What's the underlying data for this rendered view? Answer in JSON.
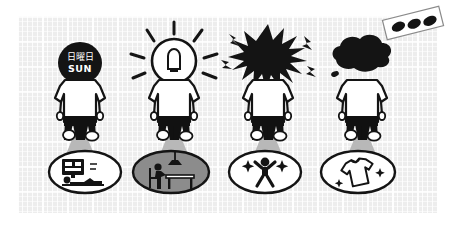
{
  "scene": {
    "title": "Daily routine four-panel illustration",
    "panel": {
      "name": "grid-paper-panel",
      "background_color": "#ededed",
      "grid_color": "#ffffff"
    },
    "palette": {
      "ink": "#1a1a1a",
      "shirt": "#ffffff",
      "pants": "#111111",
      "spotlight": "#b8b8b8",
      "oval_fill_gray": "#8c8c8c",
      "panel_bg": "#ededed"
    }
  },
  "figures": [
    {
      "id": "figure-sunday",
      "head_state": "black-round-head-with-calendar-text",
      "head_icon": "calendar-head-icon",
      "label_kanji": "日曜日",
      "label_roman": "SUN",
      "label_color": "#ffffff",
      "shirt_color": "#ffffff",
      "pants_color": "#111111",
      "spotlight": true
    },
    {
      "id": "figure-idea",
      "head_state": "glowing-lightbulb-head",
      "head_icon": "lightbulb-head-icon",
      "label_kanji": "",
      "label_roman": "",
      "ray_count": 8,
      "shirt_color": "#ffffff",
      "pants_color": "#111111",
      "spotlight": true
    },
    {
      "id": "figure-stress",
      "head_state": "spiky-black-explosion-head",
      "head_icon": "explosion-head-icon",
      "label_kanji": "",
      "label_roman": "",
      "bolt_count": 4,
      "shirt_color": "#ffffff",
      "pants_color": "#111111",
      "spotlight": true
    },
    {
      "id": "figure-gloom",
      "head_state": "dark-cloud-over-head",
      "head_icon": "rain-cloud-head-icon",
      "label_kanji": "",
      "label_roman": "",
      "shirt_color": "#ffffff",
      "pants_color": "#111111",
      "spotlight": true
    }
  ],
  "ovals": [
    {
      "id": "oval-watching-tv",
      "icon": "person-lying-watching-tv-icon",
      "fill": "#ffffff",
      "stroke": "#111111",
      "description": "person lying down in front of a television"
    },
    {
      "id": "oval-desk-work",
      "icon": "person-at-desk-with-lamp-icon",
      "fill": "#8c8c8c",
      "stroke": "#111111",
      "description": "person seated at a desk under a hanging lamp"
    },
    {
      "id": "oval-stretching",
      "icon": "person-arms-raised-sparkles-icon",
      "fill": "#ffffff",
      "stroke": "#111111",
      "description": "person with arms raised and sparkles"
    },
    {
      "id": "oval-clean-shirt",
      "icon": "clean-tshirt-sparkles-icon",
      "fill": "#ffffff",
      "stroke": "#111111",
      "description": "freshly laundered t-shirt with sparkles"
    }
  ],
  "tape": {
    "id": "tape-strip",
    "icon": "tape-strip-three-dots-icon",
    "dot_count": 3,
    "fill": "#ffffff",
    "dot_color": "#111111",
    "rotation_deg": -14
  }
}
